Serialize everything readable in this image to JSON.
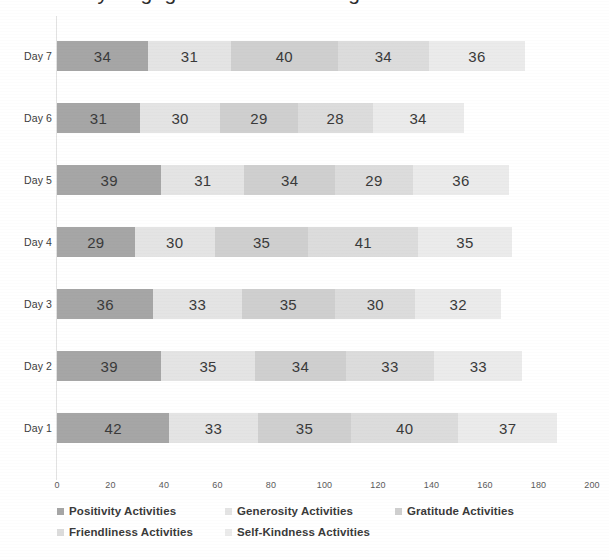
{
  "title": {
    "text": "Daily Engagement in Wellbeing Practice Activities",
    "visible_note": "cut off at top edge"
  },
  "axis": {
    "ticks": [
      0,
      20,
      40,
      60,
      80,
      100,
      120,
      140,
      160,
      180,
      200
    ],
    "min": 0,
    "max": 200
  },
  "legend": {
    "items": [
      {
        "label": "Positivity Activities",
        "color": "#a6a6a6"
      },
      {
        "label": "Generosity Activities",
        "color": "#e4e4e4"
      },
      {
        "label": "Gratitude Activities",
        "color": "#cfcfcf"
      },
      {
        "label": "Friendliness Activities",
        "color": "#dcdcdc"
      },
      {
        "label": "Self-Kindness Activities",
        "color": "#ebebeb"
      }
    ]
  },
  "chart_data": {
    "type": "bar",
    "orientation": "horizontal",
    "stacked": true,
    "title": "Daily Engagement in Wellbeing Practice Activities",
    "xlabel": "",
    "ylabel": "",
    "xlim": [
      0,
      200
    ],
    "grid": false,
    "legend_position": "bottom",
    "categories": [
      "Day 7",
      "Day 6",
      "Day 5",
      "Day 4",
      "Day 3",
      "Day 2",
      "Day 1"
    ],
    "series": [
      {
        "name": "Positivity Activities",
        "color": "#a6a6a6",
        "values": [
          34,
          31,
          39,
          29,
          36,
          39,
          42
        ]
      },
      {
        "name": "Generosity Activities",
        "color": "#e4e4e4",
        "values": [
          31,
          30,
          31,
          30,
          33,
          35,
          33
        ]
      },
      {
        "name": "Gratitude Activities",
        "color": "#cfcfcf",
        "values": [
          40,
          29,
          34,
          35,
          35,
          34,
          35
        ]
      },
      {
        "name": "Friendliness Activities",
        "color": "#dcdcdc",
        "values": [
          34,
          28,
          29,
          41,
          30,
          33,
          40
        ]
      },
      {
        "name": "Self-Kindness Activities",
        "color": "#ebebeb",
        "values": [
          36,
          34,
          36,
          35,
          32,
          33,
          37
        ]
      }
    ],
    "totals": [
      175,
      152,
      169,
      170,
      166,
      174,
      187
    ]
  }
}
